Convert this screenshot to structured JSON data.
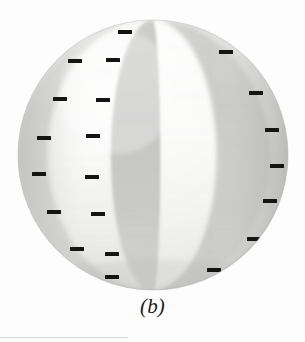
{
  "figure": {
    "caption": "(b)",
    "type": "shaded-sphere-with-lunes",
    "background_color": "#fdfdfd",
    "sphere": {
      "center_x": 153,
      "center_y": 155,
      "radius": 135,
      "base_light": "#f2f2f0",
      "base_mid": "#dcdcda",
      "base_dark": "#bdbdbb",
      "outline_color": "#b4b4b2"
    },
    "lunes": [
      {
        "name": "left-limb-band",
        "shade": "#cfcfcd",
        "left_fraction": -1.0,
        "right_fraction": -0.78
      },
      {
        "name": "left-light-lune",
        "shade": "#ececeb",
        "left_fraction": -0.78,
        "right_fraction": -0.3
      },
      {
        "name": "left-dark-lune",
        "shade": "#c8c8c6",
        "left_fraction": -0.3,
        "right_fraction": -0.02
      },
      {
        "name": "center-bright-lune",
        "shade": "#f6f6f5",
        "left_fraction": -0.02,
        "right_fraction": 0.46
      },
      {
        "name": "right-dark-lune",
        "shade": "#cccccA",
        "left_fraction": 0.46,
        "right_fraction": 0.84
      },
      {
        "name": "right-limb-band",
        "shade": "#dadad8",
        "left_fraction": 0.84,
        "right_fraction": 1.0
      }
    ],
    "tick_marks": {
      "color": "#141414",
      "width": 14,
      "height": 4,
      "count": 21,
      "positions": [
        {
          "x": 125,
          "y": 32
        },
        {
          "x": 226,
          "y": 52
        },
        {
          "x": 75,
          "y": 61
        },
        {
          "x": 113,
          "y": 60
        },
        {
          "x": 60,
          "y": 99
        },
        {
          "x": 103,
          "y": 100
        },
        {
          "x": 256,
          "y": 93
        },
        {
          "x": 44,
          "y": 138
        },
        {
          "x": 93,
          "y": 136
        },
        {
          "x": 272,
          "y": 130
        },
        {
          "x": 39,
          "y": 174
        },
        {
          "x": 92,
          "y": 177
        },
        {
          "x": 277,
          "y": 166
        },
        {
          "x": 54,
          "y": 212
        },
        {
          "x": 98,
          "y": 214
        },
        {
          "x": 270,
          "y": 201
        },
        {
          "x": 77,
          "y": 249
        },
        {
          "x": 112,
          "y": 254
        },
        {
          "x": 254,
          "y": 239
        },
        {
          "x": 112,
          "y": 277
        },
        {
          "x": 214,
          "y": 270
        }
      ]
    }
  }
}
